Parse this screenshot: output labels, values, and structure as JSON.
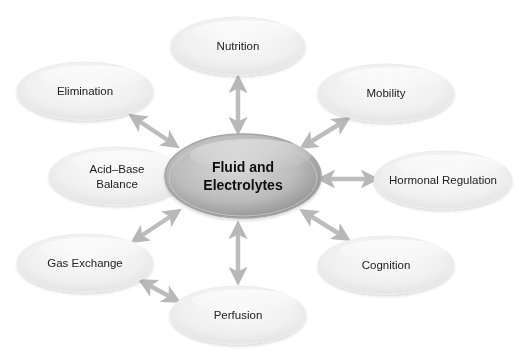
{
  "diagram": {
    "type": "hub-and-spoke",
    "center": {
      "id": "fluid",
      "lines": [
        "Fluid and",
        "Electrolytes"
      ],
      "cx": 243,
      "cy": 176,
      "rx": 78,
      "ry": 42
    },
    "nodes": [
      {
        "id": "nutrition",
        "lines": [
          "Nutrition"
        ],
        "cx": 238,
        "cy": 46,
        "rx": 67,
        "ry": 29
      },
      {
        "id": "elimination",
        "lines": [
          "Elimination"
        ],
        "cx": 85,
        "cy": 91,
        "rx": 68,
        "ry": 29
      },
      {
        "id": "mobility",
        "lines": [
          "Mobility"
        ],
        "cx": 386,
        "cy": 93,
        "rx": 68,
        "ry": 29
      },
      {
        "id": "acid-base",
        "lines": [
          "Acid–Base",
          "Balance"
        ],
        "cx": 117,
        "cy": 176,
        "rx": 68,
        "ry": 29
      },
      {
        "id": "hormonal",
        "lines": [
          "Hormonal Regulation"
        ],
        "cx": 443,
        "cy": 180,
        "rx": 69,
        "ry": 29
      },
      {
        "id": "gas-exchange",
        "lines": [
          "Gas Exchange"
        ],
        "cx": 85,
        "cy": 263,
        "rx": 68,
        "ry": 29
      },
      {
        "id": "cognition",
        "lines": [
          "Cognition"
        ],
        "cx": 386,
        "cy": 265,
        "rx": 68,
        "ry": 29
      },
      {
        "id": "perfusion",
        "lines": [
          "Perfusion"
        ],
        "cx": 238,
        "cy": 315,
        "rx": 68,
        "ry": 29
      }
    ],
    "edges": [
      {
        "from": "fluid",
        "to": "nutrition",
        "x1": 238,
        "y1": 130,
        "x2": 238,
        "y2": 80
      },
      {
        "from": "fluid",
        "to": "elimination",
        "x1": 175,
        "y1": 145,
        "x2": 133,
        "y2": 117
      },
      {
        "from": "fluid",
        "to": "mobility",
        "x1": 304,
        "y1": 146,
        "x2": 346,
        "y2": 120
      },
      {
        "from": "fluid",
        "to": "hormonal",
        "x1": 322,
        "y1": 179,
        "x2": 374,
        "y2": 179
      },
      {
        "from": "fluid",
        "to": "gas-exchange",
        "x1": 177,
        "y1": 212,
        "x2": 135,
        "y2": 240
      },
      {
        "from": "fluid",
        "to": "cognition",
        "x1": 304,
        "y1": 212,
        "x2": 346,
        "y2": 238
      },
      {
        "from": "fluid",
        "to": "perfusion",
        "x1": 238,
        "y1": 226,
        "x2": 238,
        "y2": 280
      },
      {
        "from": "gas-exchange",
        "to": "perfusion",
        "x1": 143,
        "y1": 282,
        "x2": 176,
        "y2": 300
      }
    ],
    "colors": {
      "arrow": "#bdbdbd",
      "node_fill_top": "#f4f4f4",
      "node_fill_bottom": "#ebebeb",
      "center_fill_light": "#d6d6d6",
      "center_fill_dark": "#9c9c9c",
      "text": "#222222"
    }
  }
}
